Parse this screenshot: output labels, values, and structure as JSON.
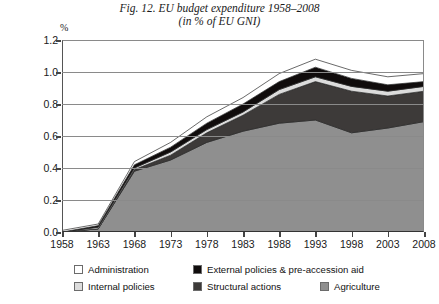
{
  "title": {
    "line1": "Fig. 12. EU budget expenditure 1958–2008",
    "line2": "(in % of EU GNI)"
  },
  "axes": {
    "y_unit_label": "%",
    "y_tick_labels": [
      "1.2",
      "1.0",
      "0.8",
      "0.6",
      "0.4",
      "0.2",
      "0.0"
    ],
    "x_tick_labels": [
      "1958",
      "1963",
      "1968",
      "1973",
      "1978",
      "1983",
      "1988",
      "1993",
      "1998",
      "2003",
      "2008"
    ]
  },
  "legend": {
    "entries": [
      {
        "label": "Administration",
        "color": "#ffffff"
      },
      {
        "label": "External policies & pre-accession aid",
        "color": "#100c0c"
      },
      {
        "label": "Internal policies",
        "color": "#dcdcdc"
      },
      {
        "label": "Structural actions",
        "color": "#3d3a39"
      },
      {
        "label": "Agriculture",
        "color": "#8f8f8f"
      }
    ]
  },
  "chart_data": {
    "type": "area",
    "stacked": true,
    "title": "Fig. 12. EU budget expenditure 1958–2008 (in % of EU GNI)",
    "subtitle": "(in % of EU GNI)",
    "xlabel": "",
    "ylabel": "%",
    "x": [
      1958,
      1963,
      1968,
      1973,
      1978,
      1983,
      1988,
      1993,
      1998,
      2003,
      2008
    ],
    "xlim": [
      1958,
      2008
    ],
    "ylim": [
      0.0,
      1.2
    ],
    "y_ticks": [
      0.0,
      0.2,
      0.4,
      0.6,
      0.8,
      1.0,
      1.2
    ],
    "grid": true,
    "legend_position": "below",
    "series": [
      {
        "name": "Agriculture",
        "color": "#8f8f8f",
        "values": [
          0.0,
          0.02,
          0.38,
          0.45,
          0.56,
          0.63,
          0.68,
          0.7,
          0.62,
          0.65,
          0.69
        ]
      },
      {
        "name": "Structural actions",
        "color": "#3d3a39",
        "values": [
          0.0,
          0.0,
          0.01,
          0.03,
          0.06,
          0.1,
          0.18,
          0.24,
          0.26,
          0.2,
          0.19
        ]
      },
      {
        "name": "Internal policies",
        "color": "#dcdcdc",
        "values": [
          0.0,
          0.01,
          0.01,
          0.02,
          0.02,
          0.02,
          0.03,
          0.03,
          0.03,
          0.03,
          0.03
        ]
      },
      {
        "name": "External policies & pre-accession aid",
        "color": "#100c0c",
        "values": [
          0.0,
          0.01,
          0.02,
          0.03,
          0.04,
          0.05,
          0.05,
          0.06,
          0.05,
          0.04,
          0.03
        ]
      },
      {
        "name": "Administration",
        "color": "#ffffff",
        "values": [
          0.01,
          0.01,
          0.02,
          0.03,
          0.04,
          0.04,
          0.05,
          0.05,
          0.05,
          0.05,
          0.05
        ]
      }
    ],
    "totals": [
      0.01,
      0.05,
      0.44,
      0.56,
      0.72,
      0.84,
      0.99,
      1.07,
      1.0,
      0.9,
      0.95
    ]
  }
}
